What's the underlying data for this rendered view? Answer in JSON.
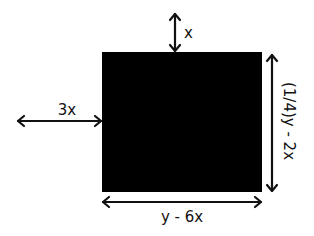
{
  "diagram": {
    "rectangle": {
      "fill": "#000000",
      "x": 102,
      "y": 52,
      "width": 160,
      "height": 140
    },
    "colors": {
      "background": "#ffffff",
      "stroke": "#111111",
      "text": "#111111"
    },
    "labels": {
      "top_gap": "x",
      "left_gap": "3x",
      "height": "(1/4)y - 2x",
      "width": "y - 6x"
    }
  }
}
